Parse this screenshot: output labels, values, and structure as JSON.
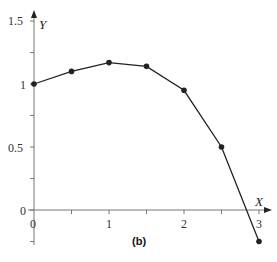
{
  "chart_data": {
    "type": "line",
    "title": "",
    "caption": "(b)",
    "xlabel": "X",
    "ylabel": "Y",
    "xlim": [
      0,
      3
    ],
    "ylim": [
      -0.25,
      1.5
    ],
    "x_ticks": [
      0,
      0.5,
      1,
      1.5,
      2,
      2.5,
      3
    ],
    "x_tick_labels": [
      "0",
      "1",
      "2",
      "3"
    ],
    "y_ticks": [
      0,
      0.25,
      0.5,
      0.75,
      1,
      1.25,
      1.5
    ],
    "y_tick_labels": [
      "0",
      "0.5",
      "1",
      "1.5"
    ],
    "grid": false,
    "legend": null,
    "series": [
      {
        "name": "Y",
        "x": [
          0,
          0.5,
          1,
          1.5,
          2,
          2.5,
          3
        ],
        "values": [
          1.0,
          1.1,
          1.17,
          1.14,
          0.95,
          0.5,
          -0.25
        ],
        "marker": "circle",
        "color": "#222222"
      }
    ]
  },
  "labels": {
    "x_axis": "X",
    "y_axis": "Y",
    "caption": "(b)",
    "xt0": "0",
    "xt1": "1",
    "xt2": "2",
    "xt3": "3",
    "yt0": "0",
    "yt05": "0.5",
    "yt1": "1",
    "yt15": "1.5"
  },
  "colors": {
    "line": "#222222",
    "axis": "#777777"
  }
}
